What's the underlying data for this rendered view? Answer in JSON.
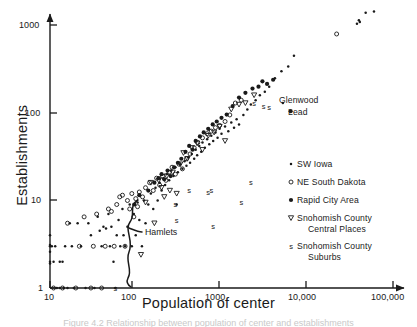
{
  "figure": {
    "background": "#ffffff",
    "ink_color": "#1a1a1a"
  },
  "caption": {
    "text": "Figure 4.2  Relationship between population of center and establishments"
  },
  "chart_data": {
    "type": "scatter",
    "title": "",
    "xlabel": "Population of center",
    "ylabel": "Establishments",
    "xscale": "log",
    "yscale": "log",
    "xlim": [
      10,
      100000
    ],
    "ylim": [
      1,
      2000
    ],
    "grid": false,
    "xticks": [
      10,
      100,
      1000,
      10000,
      100000
    ],
    "xtick_labels": [
      "10",
      "100",
      "1000",
      "10,000",
      "100,000"
    ],
    "yticks": [
      1,
      10,
      100,
      1000
    ],
    "ytick_labels": [
      "1",
      "10",
      "100",
      "1000"
    ],
    "legend_position": "right-middle",
    "series": [
      {
        "name": "SW Iowa",
        "marker": "small-dot",
        "points": [
          [
            10,
            3.0
          ],
          [
            10,
            3.1
          ],
          [
            10,
            2.0
          ],
          [
            10,
            1.9
          ],
          [
            10,
            2.6
          ],
          [
            10,
            4.0
          ],
          [
            10.5,
            3.0
          ],
          [
            11,
            2.0
          ],
          [
            11.5,
            3.0
          ],
          [
            12,
            1.0
          ],
          [
            13,
            1.0
          ],
          [
            13,
            2.0
          ],
          [
            14,
            2.0
          ],
          [
            14.5,
            1.0
          ],
          [
            15,
            3.0
          ],
          [
            16,
            1.0
          ],
          [
            17,
            5.5
          ],
          [
            18,
            3.0
          ],
          [
            19,
            1.0
          ],
          [
            21,
            5.5
          ],
          [
            23,
            3.0
          ],
          [
            26,
            1.0
          ],
          [
            28,
            5.5
          ],
          [
            30,
            4.0
          ],
          [
            33,
            1.0
          ],
          [
            36,
            6.5
          ],
          [
            38,
            4.5
          ],
          [
            40,
            3.0
          ],
          [
            42,
            5.0
          ],
          [
            45,
            4.8
          ],
          [
            48,
            7.0
          ],
          [
            50,
            3.0
          ],
          [
            52,
            5.0
          ],
          [
            55,
            2.0
          ],
          [
            58,
            1.0
          ],
          [
            60,
            4.0
          ],
          [
            63,
            6.0
          ],
          [
            66,
            3.0
          ],
          [
            70,
            8.0
          ],
          [
            72,
            4.0
          ],
          [
            75,
            3.0
          ],
          [
            80,
            5.0
          ],
          [
            85,
            9.0
          ],
          [
            90,
            3.0
          ],
          [
            95,
            7.0
          ],
          [
            100,
            4.0
          ],
          [
            105,
            9.5
          ],
          [
            110,
            6.0
          ],
          [
            118,
            3.0
          ],
          [
            125,
            10.0
          ],
          [
            130,
            5.5
          ],
          [
            140,
            9.0
          ],
          [
            150,
            12.0
          ],
          [
            160,
            8.0
          ],
          [
            170,
            14.0
          ],
          [
            180,
            10.0
          ],
          [
            190,
            16.0
          ],
          [
            200,
            13.0
          ],
          [
            210,
            18.0
          ],
          [
            220,
            15.0
          ],
          [
            230,
            20.0
          ],
          [
            245,
            17.0
          ],
          [
            260,
            22.0
          ],
          [
            275,
            19.0
          ],
          [
            290,
            24.0
          ],
          [
            300,
            9.0
          ],
          [
            310,
            21.0
          ],
          [
            330,
            26.0
          ],
          [
            350,
            23.0
          ],
          [
            370,
            28.0
          ],
          [
            390,
            25.0
          ],
          [
            410,
            31.0
          ],
          [
            430,
            27.0
          ],
          [
            450,
            34.0
          ],
          [
            480,
            30.0
          ],
          [
            500,
            38.0
          ],
          [
            520,
            33.0
          ],
          [
            550,
            42.0
          ],
          [
            580,
            36.0
          ],
          [
            600,
            46.0
          ],
          [
            640,
            40.0
          ],
          [
            680,
            50.0
          ],
          [
            720,
            44.0
          ],
          [
            760,
            55.0
          ],
          [
            800,
            48.0
          ],
          [
            850,
            60.0
          ],
          [
            900,
            52.0
          ],
          [
            950,
            66.0
          ],
          [
            1000,
            58.0
          ],
          [
            1100,
            70.0
          ],
          [
            1200,
            62.0
          ],
          [
            1300,
            78.0
          ],
          [
            1400,
            68.0
          ],
          [
            1500,
            85.0
          ],
          [
            1600,
            74.0
          ],
          [
            1800,
            95.0
          ],
          [
            2000,
            110.0
          ],
          [
            2200,
            125.0
          ],
          [
            2500,
            140.0
          ],
          [
            2800,
            160.0
          ],
          [
            3200,
            175.0
          ],
          [
            3600,
            200.0
          ],
          [
            4200,
            250.0
          ],
          [
            5000,
            300.0
          ],
          [
            6000,
            340.0
          ],
          [
            7000,
            450.0
          ],
          [
            38000,
            1050.0
          ],
          [
            40000,
            1150.0
          ],
          [
            41000,
            1100.0
          ],
          [
            48000,
            1400.0
          ],
          [
            60000,
            1450.0
          ]
        ]
      },
      {
        "name": "NE South Dakota",
        "marker": "open-circle",
        "points": [
          [
            11,
            1.0
          ],
          [
            14,
            1.0
          ],
          [
            16,
            5.5
          ],
          [
            20,
            1.0
          ],
          [
            22,
            3.0
          ],
          [
            25,
            6.5
          ],
          [
            30,
            1.0
          ],
          [
            32,
            3.0
          ],
          [
            35,
            7.0
          ],
          [
            40,
            1.0
          ],
          [
            44,
            3.0
          ],
          [
            48,
            8.0
          ],
          [
            52,
            7.5
          ],
          [
            56,
            3.0
          ],
          [
            60,
            9.0
          ],
          [
            65,
            11.0
          ],
          [
            70,
            11.5
          ],
          [
            75,
            3.0
          ],
          [
            80,
            10.0
          ],
          [
            85,
            8.0
          ],
          [
            90,
            12.0
          ],
          [
            95,
            6.5
          ],
          [
            100,
            10.5
          ],
          [
            105,
            8.5
          ],
          [
            110,
            12.5
          ],
          [
            120,
            11.0
          ],
          [
            130,
            14.0
          ],
          [
            145,
            16.0
          ],
          [
            160,
            13.0
          ],
          [
            175,
            18.0
          ],
          [
            190,
            15.0
          ],
          [
            205,
            19.0
          ],
          [
            225,
            17.0
          ],
          [
            245,
            21.0
          ],
          [
            265,
            24.0
          ],
          [
            290,
            20.0
          ],
          [
            320,
            26.0
          ],
          [
            350,
            23.0
          ],
          [
            390,
            30.0
          ],
          [
            430,
            34.0
          ],
          [
            480,
            40.0
          ],
          [
            530,
            46.0
          ],
          [
            600,
            52.0
          ],
          [
            680,
            58.0
          ],
          [
            760,
            62.0
          ],
          [
            850,
            68.0
          ],
          [
            950,
            72.0
          ],
          [
            1100,
            80.0
          ],
          [
            1250,
            95.0
          ],
          [
            1450,
            130.0
          ],
          [
            1700,
            140.0
          ],
          [
            22000,
            800.0
          ]
        ]
      },
      {
        "name": "Rapid City Area",
        "marker": "filled-circle",
        "points": [
          [
            96,
            9.0
          ],
          [
            110,
            11.5
          ],
          [
            140,
            13.0
          ],
          [
            165,
            16.0
          ],
          [
            185,
            18.0
          ],
          [
            200,
            20.0
          ],
          [
            215,
            17.5
          ],
          [
            235,
            22.0
          ],
          [
            255,
            19.0
          ],
          [
            280,
            24.0
          ],
          [
            310,
            27.0
          ],
          [
            340,
            30.0
          ],
          [
            380,
            36.0
          ],
          [
            420,
            42.0
          ],
          [
            460,
            38.0
          ],
          [
            500,
            48.0
          ],
          [
            560,
            54.0
          ],
          [
            620,
            60.0
          ],
          [
            700,
            66.0
          ],
          [
            790,
            74.0
          ],
          [
            880,
            80.0
          ],
          [
            1000,
            88.0
          ],
          [
            1150,
            96.0
          ],
          [
            1350,
            120.0
          ],
          [
            1600,
            150.0
          ],
          [
            1900,
            170.0
          ],
          [
            2300,
            190.0
          ],
          [
            2700,
            200.0
          ],
          [
            3000,
            230.0
          ],
          [
            3400,
            215.0
          ],
          [
            4000,
            240.0
          ]
        ]
      },
      {
        "name": "Snohomish County Central Places",
        "marker": "open-triangle-down",
        "points": [
          [
            115,
            2.4
          ],
          [
            130,
            9.5
          ],
          [
            150,
            16.0
          ],
          [
            165,
            5.5
          ],
          [
            185,
            17.0
          ],
          [
            200,
            14.0
          ],
          [
            215,
            11.0
          ],
          [
            230,
            19.0
          ],
          [
            250,
            13.0
          ],
          [
            270,
            21.0
          ],
          [
            300,
            12.0
          ],
          [
            330,
            26.0
          ],
          [
            360,
            35.0
          ],
          [
            400,
            30.0
          ],
          [
            450,
            40.0
          ],
          [
            520,
            45.0
          ],
          [
            600,
            38.0
          ],
          [
            700,
            55.0
          ],
          [
            820,
            60.0
          ],
          [
            950,
            70.0
          ],
          [
            1100,
            48.0
          ],
          [
            1300,
            110.0
          ],
          [
            1600,
            125.0
          ],
          [
            1900,
            130.0
          ],
          [
            2400,
            160.0
          ]
        ]
      },
      {
        "name": "Snohomish County Suburbs",
        "marker": "letter-s",
        "points": [
          [
            58,
            1.0
          ],
          [
            290,
            9.0
          ],
          [
            300,
            6.0
          ],
          [
            420,
            13.0
          ],
          [
            700,
            12.5
          ],
          [
            760,
            13.0
          ],
          [
            800,
            5.0
          ],
          [
            1700,
            9.5
          ],
          [
            2200,
            16.0
          ],
          [
            2400,
            130.0
          ],
          [
            3100,
            120.0
          ],
          [
            3600,
            115.0
          ]
        ]
      }
    ],
    "annotations": [
      {
        "text": "Glenwood",
        "x": 5200,
        "y": 130,
        "marker": "small-dot"
      },
      {
        "text": "Lead",
        "x": 6400,
        "y": 105,
        "marker": "filled-circle"
      },
      {
        "text": "Hamlets",
        "bracket": true,
        "x_range": [
          100,
          135
        ],
        "y_range": [
          1,
          10
        ]
      }
    ]
  },
  "axes": {
    "x_title": "Population of center",
    "y_title": "Establishments",
    "x_tick_labels": [
      "10",
      "100",
      "1000",
      "10,000",
      "100,000"
    ],
    "y_tick_labels": [
      "1",
      "10",
      "100",
      "1000"
    ]
  },
  "legend": {
    "entries": [
      {
        "label": "SW Iowa",
        "marker": "small-dot",
        "label2": ""
      },
      {
        "label": "NE South Dakota",
        "marker": "open-circle",
        "label2": ""
      },
      {
        "label": "Rapid City Area",
        "marker": "filled-circle",
        "label2": ""
      },
      {
        "label": "Snohomish County",
        "marker": "open-triangle-down",
        "label2": "Central Places"
      },
      {
        "label": "Snohomish County",
        "marker": "letter-s",
        "label2": "Suburbs"
      }
    ]
  },
  "annotations": {
    "glenwood": "Glenwood",
    "lead": "Lead",
    "hamlets": "Hamlets"
  }
}
